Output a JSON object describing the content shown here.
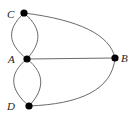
{
  "diagram": {
    "type": "graph",
    "nodes": [
      {
        "id": "C",
        "label": "C",
        "x": 24,
        "y": 13,
        "lx": 7,
        "ly": 18
      },
      {
        "id": "A",
        "label": "A",
        "x": 27,
        "y": 59,
        "lx": 8,
        "ly": 63
      },
      {
        "id": "B",
        "label": "B",
        "x": 115,
        "y": 58,
        "lx": 121,
        "ly": 62
      },
      {
        "id": "D",
        "label": "D",
        "x": 29,
        "y": 106,
        "lx": 7,
        "ly": 110
      }
    ],
    "edges": [
      {
        "from": "C",
        "to": "A",
        "kind": "curve-left"
      },
      {
        "from": "C",
        "to": "A",
        "kind": "curve-right"
      },
      {
        "from": "A",
        "to": "D",
        "kind": "curve-left"
      },
      {
        "from": "A",
        "to": "D",
        "kind": "curve-right"
      },
      {
        "from": "A",
        "to": "B",
        "kind": "straight"
      },
      {
        "from": "C",
        "to": "B",
        "kind": "arc"
      },
      {
        "from": "D",
        "to": "B",
        "kind": "arc"
      }
    ],
    "colors": {
      "edge": "#6a6a6a",
      "node": "#000000",
      "label": "#222222"
    }
  }
}
